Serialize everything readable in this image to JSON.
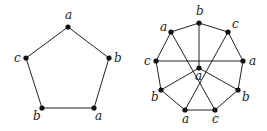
{
  "graphs": [
    {
      "name": "pentagon",
      "nodes": [
        {
          "id": "p0",
          "label": "a",
          "x": 68,
          "y": 27,
          "lx": 65,
          "ly": 19
        },
        {
          "id": "p1",
          "label": "b",
          "x": 109,
          "y": 58,
          "lx": 114,
          "ly": 62
        },
        {
          "id": "p2",
          "label": "a",
          "x": 94,
          "y": 108,
          "lx": 95,
          "ly": 120
        },
        {
          "id": "p3",
          "label": "b",
          "x": 42,
          "y": 108,
          "lx": 33,
          "ly": 120
        },
        {
          "id": "p4",
          "label": "c",
          "x": 26,
          "y": 58,
          "lx": 14,
          "ly": 62
        }
      ],
      "edges": [
        [
          "p0",
          "p1"
        ],
        [
          "p1",
          "p2"
        ],
        [
          "p2",
          "p3"
        ],
        [
          "p3",
          "p4"
        ],
        [
          "p4",
          "p0"
        ]
      ]
    },
    {
      "name": "nonagon-with-center",
      "nodes": [
        {
          "id": "q0",
          "label": "b",
          "x": 199,
          "y": 23,
          "lx": 196,
          "ly": 15
        },
        {
          "id": "q1",
          "label": "c",
          "x": 228,
          "y": 32,
          "lx": 232,
          "ly": 28
        },
        {
          "id": "q2",
          "label": "a",
          "x": 243,
          "y": 61,
          "lx": 249,
          "ly": 65
        },
        {
          "id": "q3",
          "label": "b",
          "x": 238,
          "y": 90,
          "lx": 242,
          "ly": 101
        },
        {
          "id": "q4",
          "label": "c",
          "x": 215,
          "y": 110,
          "lx": 212,
          "ly": 123
        },
        {
          "id": "q5",
          "label": "a",
          "x": 185,
          "y": 110,
          "lx": 182,
          "ly": 123
        },
        {
          "id": "q6",
          "label": "b",
          "x": 161,
          "y": 90,
          "lx": 151,
          "ly": 101
        },
        {
          "id": "q7",
          "label": "c",
          "x": 156,
          "y": 61,
          "lx": 144,
          "ly": 65
        },
        {
          "id": "q8",
          "label": "a",
          "x": 171,
          "y": 32,
          "lx": 160,
          "ly": 31
        },
        {
          "id": "qc",
          "label": "a",
          "x": 199,
          "y": 68,
          "lx": 195,
          "ly": 80
        }
      ],
      "edges": [
        [
          "q0",
          "q1"
        ],
        [
          "q1",
          "q2"
        ],
        [
          "q2",
          "q3"
        ],
        [
          "q3",
          "q4"
        ],
        [
          "q4",
          "q5"
        ],
        [
          "q5",
          "q6"
        ],
        [
          "q6",
          "q7"
        ],
        [
          "q7",
          "q8"
        ],
        [
          "q8",
          "q0"
        ],
        [
          "q0",
          "qc"
        ],
        [
          "q7",
          "q2"
        ],
        [
          "q8",
          "q4"
        ],
        [
          "q1",
          "q5"
        ],
        [
          "qc",
          "q6"
        ],
        [
          "qc",
          "q3"
        ]
      ]
    }
  ]
}
